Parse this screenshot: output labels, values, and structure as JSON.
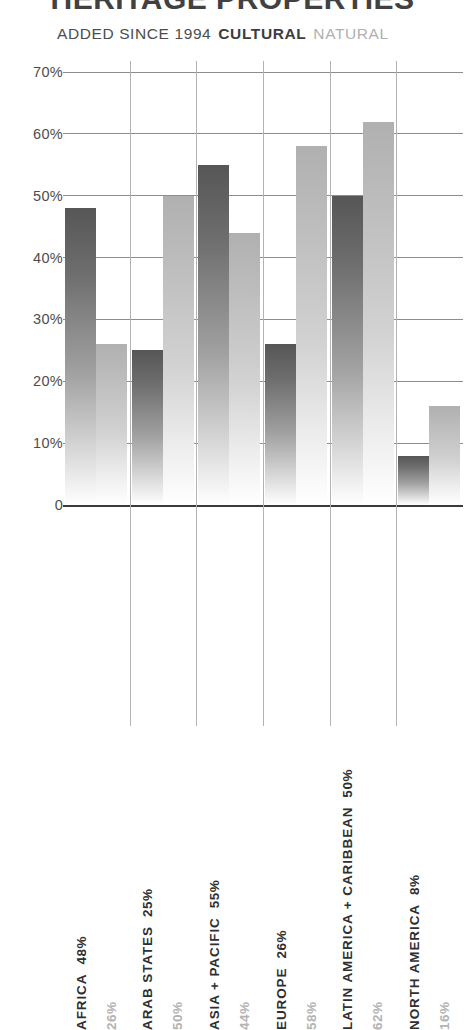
{
  "header": {
    "title": "HERITAGE PROPERTIES",
    "subtitle": "ADDED SINCE 1994",
    "legend_cultural": "CULTURAL",
    "legend_natural": "NATURAL"
  },
  "colors": {
    "cultural": "#565656",
    "natural": "#b0b0b0",
    "grid": "#8d8d8d",
    "axis": "#3a3a3a",
    "text": "#3b3b3b"
  },
  "chart_data": {
    "type": "bar",
    "title": "HERITAGE PROPERTIES",
    "subtitle": "ADDED SINCE 1994",
    "xlabel": "",
    "ylabel": "",
    "ylim": [
      0,
      70
    ],
    "grid": true,
    "legend_position": "top-left",
    "ytick_labels": [
      "70%",
      "60%",
      "50%",
      "40%",
      "30%",
      "20%",
      "10%",
      "0"
    ],
    "ytick_values": [
      70,
      60,
      50,
      40,
      30,
      20,
      10,
      0
    ],
    "categories": [
      "AFRICA",
      "ARAB STATES",
      "ASIA + PACIFIC",
      "EUROPE",
      "LATIN AMERICA + CARIBBEAN",
      "NORTH AMERICA"
    ],
    "series": [
      {
        "name": "CULTURAL",
        "values": [
          48,
          25,
          55,
          26,
          50,
          8
        ],
        "value_labels": [
          "48%",
          "25%",
          "55%",
          "26%",
          "50%",
          "8%"
        ]
      },
      {
        "name": "NATURAL",
        "values": [
          26,
          50,
          44,
          58,
          62,
          16
        ],
        "value_labels": [
          "26%",
          "50%",
          "44%",
          "58%",
          "62%",
          "16%"
        ]
      }
    ]
  }
}
